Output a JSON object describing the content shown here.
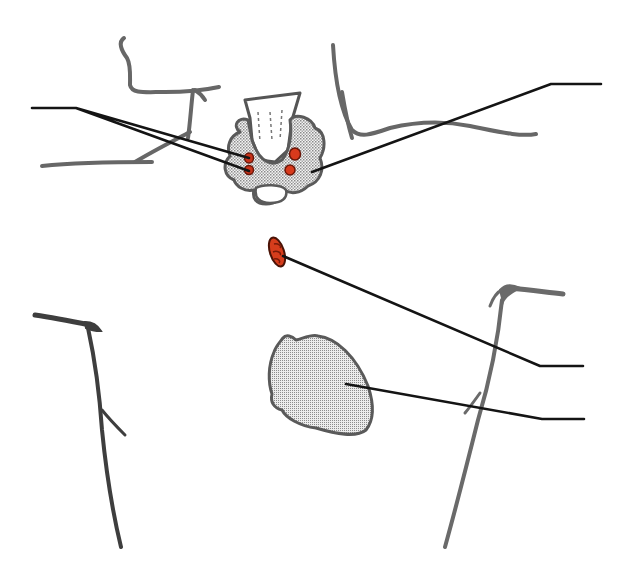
{
  "diagram": {
    "type": "anatomical-schematic",
    "labels": [],
    "colors": {
      "background": "#ffffff",
      "anatomy_outline": "#666666",
      "leader_line": "#111111",
      "organ_fill": "#d8d8d8",
      "organ_outline": "#555555",
      "parathyroid_fill": "#d23a1a",
      "parathyroid_outline": "#6a1608"
    },
    "structures": [
      {
        "name": "mandible-left",
        "kind": "outline"
      },
      {
        "name": "clavicle-left-upper",
        "kind": "outline"
      },
      {
        "name": "neck-curve-right",
        "kind": "outline"
      },
      {
        "name": "trachea",
        "kind": "organ"
      },
      {
        "name": "thyroid-gland",
        "kind": "organ"
      },
      {
        "name": "parathyroid-left-upper",
        "kind": "gland"
      },
      {
        "name": "parathyroid-left-lower",
        "kind": "gland"
      },
      {
        "name": "parathyroid-right-upper",
        "kind": "gland"
      },
      {
        "name": "parathyroid-right-lower",
        "kind": "gland"
      },
      {
        "name": "ectopic-parathyroid-mediastinal",
        "kind": "gland"
      },
      {
        "name": "heart",
        "kind": "organ"
      },
      {
        "name": "shoulder-left",
        "kind": "outline"
      },
      {
        "name": "shoulder-right",
        "kind": "outline"
      }
    ],
    "leader_lines": [
      {
        "name": "leader-left-parathyroids",
        "target": "parathyroid-left-upper/lower",
        "side": "left"
      },
      {
        "name": "leader-thyroid",
        "target": "thyroid-gland",
        "side": "right"
      },
      {
        "name": "leader-ectopic-parathyroid",
        "target": "ectopic-parathyroid-mediastinal",
        "side": "right"
      },
      {
        "name": "leader-heart",
        "target": "heart",
        "side": "right"
      }
    ]
  }
}
